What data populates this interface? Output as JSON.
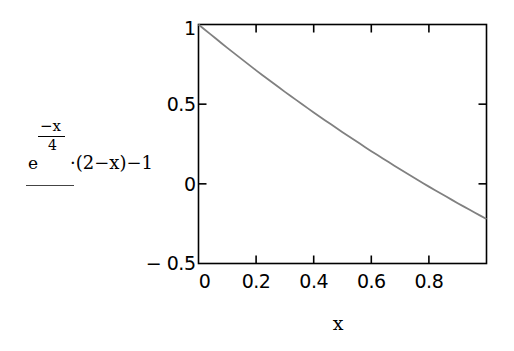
{
  "chart_data": {
    "type": "line",
    "title": "",
    "xlabel": "x",
    "ylabel": "e^(-x/4)·(2-x)-1",
    "ylabel_parts": {
      "base": "e",
      "exponent_numerator": "−x",
      "exponent_denominator": "4",
      "rest": "·(2−x)−1"
    },
    "xlim": [
      0,
      1
    ],
    "ylim": [
      -0.5,
      1
    ],
    "x_ticks": [
      0,
      0.2,
      0.4,
      0.6,
      0.8
    ],
    "x_tick_labels": [
      "0",
      "0.2",
      "0.4",
      "0.6",
      "0.8"
    ],
    "y_ticks": [
      -0.5,
      0,
      0.5,
      1
    ],
    "y_tick_labels": [
      "− 0.5",
      "0",
      "0.5",
      "1"
    ],
    "grid": false,
    "legend": null,
    "series": [
      {
        "name": "e^(-x/4)·(2-x)-1",
        "color": "#808080",
        "x": [
          0,
          0.1,
          0.2,
          0.3,
          0.4,
          0.5,
          0.6,
          0.7,
          0.8,
          0.9,
          1.0
        ],
        "y": [
          1.0,
          0.8531,
          0.7122,
          0.5771,
          0.4477,
          0.3237,
          0.205,
          0.0913,
          -0.0175,
          -0.1216,
          -0.2212
        ]
      }
    ]
  },
  "colors": {
    "frame": "#000000",
    "curve": "#808080",
    "background": "#ffffff"
  }
}
